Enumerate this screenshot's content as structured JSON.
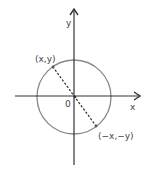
{
  "diagram": {
    "type": "unit-circle-symmetry",
    "axes": {
      "x_label": "x",
      "y_label": "y",
      "origin_label": "0",
      "color": "#333333"
    },
    "circle": {
      "color": "#888888",
      "cx": 74,
      "cy": 97,
      "r": 37
    },
    "points": [
      {
        "label": "(x,y)",
        "x": 53,
        "y": 67
      },
      {
        "label": "(−x,−y)",
        "x": 96,
        "y": 126
      }
    ],
    "dotted_line": {
      "description": "line through origin connecting (x,y) and (-x,-y)",
      "color": "#333333"
    }
  }
}
